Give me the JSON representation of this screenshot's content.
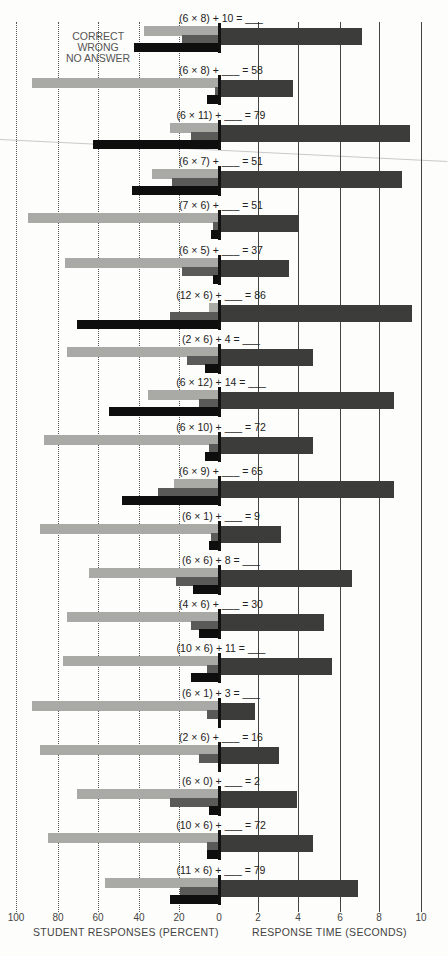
{
  "chart_data": {
    "type": "bar",
    "orientation": "horizontal-butterfly",
    "title": "",
    "left_axis": {
      "label": "STUDENT RESPONSES (PERCENT)",
      "ticks": [
        "100",
        "80",
        "60",
        "40",
        "20",
        "0"
      ],
      "range": [
        100,
        0
      ]
    },
    "right_axis": {
      "label": "RESPONSE TIME (SECONDS)",
      "ticks": [
        "2",
        "4",
        "6",
        "8",
        "10"
      ],
      "range": [
        0,
        10
      ]
    },
    "legend": [
      "CORRECT",
      "WRONG",
      "NO ANSWER"
    ],
    "grid": true,
    "categories": [
      "(6 × 8) + 10 = ___",
      "(6 × 8) + ___ = 58",
      "(6 × 11) + ___ = 79",
      "(6 × 7) + ___ = 51",
      "(7 × 6) + ___ = 51",
      "(6 × 5) + ___ = 37",
      "(12 × 6) + ___ = 86",
      "(2 × 6) + 4 = ___",
      "(6 × 12) + 14 = ___",
      "(6 × 10) + ___ = 72",
      "(6 × 9) + ___ = 65",
      "(6 × 1) + ___ = 9",
      "(6 × 6) + 8 = ___",
      "(4 × 6) + ___ = 30",
      "(10 × 6) + 11 = ___",
      "(6 × 1) + 3 = ___",
      "(2 × 6) + ___ = 16",
      "(6 × 0) + ___ = 2",
      "(10 × 6) + ___ = 72",
      "(11 × 6) + ___ = 79"
    ],
    "series": [
      {
        "name": "CORRECT",
        "unit": "percent",
        "color": "#a9a9a6",
        "values": [
          37,
          92,
          24,
          33,
          94,
          76,
          5,
          75,
          35,
          86,
          22,
          88,
          64,
          75,
          77,
          92,
          88,
          70,
          84,
          56
        ]
      },
      {
        "name": "WRONG",
        "unit": "percent",
        "color": "#5a5a58",
        "values": [
          18,
          2,
          14,
          23,
          3,
          18,
          24,
          16,
          10,
          5,
          30,
          4,
          21,
          14,
          6,
          6,
          10,
          24,
          6,
          19
        ]
      },
      {
        "name": "NO ANSWER",
        "unit": "percent",
        "color": "#0e0e0e",
        "values": [
          42,
          6,
          62,
          43,
          4,
          3,
          70,
          7,
          54,
          7,
          48,
          5,
          13,
          10,
          14,
          0,
          0,
          5,
          6,
          24
        ]
      },
      {
        "name": "RESPONSE TIME",
        "unit": "seconds",
        "color": "#3c3c3b",
        "values": [
          7.1,
          3.7,
          9.5,
          9.1,
          4.0,
          3.5,
          9.6,
          4.7,
          8.7,
          4.7,
          8.7,
          3.1,
          6.6,
          5.2,
          5.6,
          1.8,
          3.0,
          3.9,
          4.7,
          6.9
        ]
      }
    ]
  },
  "layout": {
    "zero_x": 219,
    "px_per_percent": 2.03,
    "px_per_second": 20.1,
    "row_label_y": [
      18,
      70,
      115,
      161,
      205,
      250,
      295,
      339,
      382,
      427,
      471,
      516,
      560,
      604,
      648,
      693,
      737,
      781,
      825,
      870
    ],
    "bottom_ticks": [
      {
        "label": "100",
        "x": 16
      },
      {
        "label": "80",
        "x": 58
      },
      {
        "label": "60",
        "x": 98
      },
      {
        "label": "40",
        "x": 139
      },
      {
        "label": "20",
        "x": 179
      },
      {
        "label": "0",
        "x": 219
      },
      {
        "label": "2",
        "x": 258
      },
      {
        "label": "4",
        "x": 298
      },
      {
        "label": "6",
        "x": 340
      },
      {
        "label": "8",
        "x": 379
      },
      {
        "label": "10",
        "x": 421
      }
    ]
  }
}
